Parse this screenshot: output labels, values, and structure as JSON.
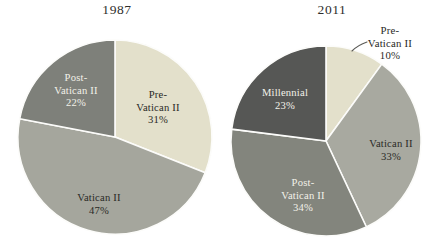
{
  "figure": {
    "background": "#ffffff",
    "divider_color": "#fcfcfa",
    "leader_line_color": "#5a5a56"
  },
  "chart_data": [
    {
      "type": "pie",
      "title": "1987",
      "start_angle": 0,
      "legend": "none",
      "categories": [
        "Pre-Vatican II",
        "Vatican II",
        "Post-Vatican II"
      ],
      "values": [
        31,
        47,
        22
      ],
      "slices": [
        {
          "label": "Pre-Vatican II",
          "value": 31,
          "display_lines": [
            "Pre-",
            "Vatican II",
            "31%"
          ],
          "color": "#e3e0cb",
          "text_color": "#2a2a26"
        },
        {
          "label": "Vatican II",
          "value": 47,
          "display_lines": [
            "Vatican II",
            "47%"
          ],
          "color": "#a5a69d",
          "text_color": "#2a2a26"
        },
        {
          "label": "Post-Vatican II",
          "value": 22,
          "display_lines": [
            "Post-",
            "Vatican II",
            "22%"
          ],
          "color": "#7e807a",
          "text_color": "#f2f1e9"
        }
      ]
    },
    {
      "type": "pie",
      "title": "2011",
      "start_angle": 0,
      "legend": "none",
      "categories": [
        "Pre-Vatican II",
        "Vatican II",
        "Post-Vatican II",
        "Millennial"
      ],
      "values": [
        10,
        33,
        34,
        23
      ],
      "slices": [
        {
          "label": "Pre-Vatican II",
          "value": 10,
          "display_lines": [
            "Pre-",
            "Vatican II",
            "10%"
          ],
          "color": "#e3e0cb",
          "text_color": "#2a2a26",
          "callout": true
        },
        {
          "label": "Vatican II",
          "value": 33,
          "display_lines": [
            "Vatican II",
            "33%"
          ],
          "color": "#a8a9a0",
          "text_color": "#2a2a26"
        },
        {
          "label": "Post-Vatican II",
          "value": 34,
          "display_lines": [
            "Post-",
            "Vatican II",
            "34%"
          ],
          "color": "#83857d",
          "text_color": "#f2f1e9"
        },
        {
          "label": "Millennial",
          "value": 23,
          "display_lines": [
            "Millennial",
            "23%"
          ],
          "color": "#565755",
          "text_color": "#f2f1e9"
        }
      ]
    }
  ]
}
